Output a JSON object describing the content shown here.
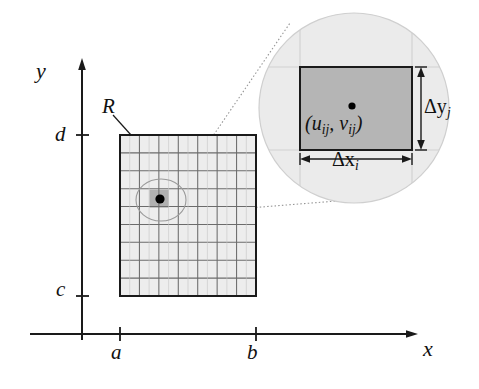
{
  "figure": {
    "axes": {
      "x_label": "x",
      "y_label": "y",
      "x_ticks": [
        {
          "label": "a",
          "value": "a"
        },
        {
          "label": "b",
          "value": "b"
        }
      ],
      "y_ticks": [
        {
          "label": "d",
          "value": "d"
        },
        {
          "label": "c",
          "value": "c"
        }
      ]
    },
    "region": {
      "label": "R",
      "columns": 7,
      "rows": 9,
      "x_from": "a",
      "x_to": "b",
      "y_from": "c",
      "y_to": "d",
      "fill_color": "#ededed",
      "grid_line_color": "#6b6b6b",
      "border_color": "#1a1a1a"
    },
    "highlighted_cell": {
      "fill_color": "#b3b3b3",
      "sample_point_color": "#000000"
    },
    "magnifier": {
      "fill_color": "#ebebeb",
      "edge_color": "#c8c8c8",
      "cell_fill_color": "#b5b5b5",
      "cell_border_color": "#1a1a1a",
      "sample_point_label": "(u",
      "sample_point_label_sub1": "ij",
      "sample_point_label_mid": ", v",
      "sample_point_label_sub2": "ij",
      "sample_point_label_end": ")",
      "width_label_delta": "Δx",
      "width_label_sub": "i",
      "height_label_delta": "Δy",
      "height_label_sub": "j"
    },
    "connector": {
      "style": "dotted",
      "color": "#8f8f8f"
    }
  }
}
